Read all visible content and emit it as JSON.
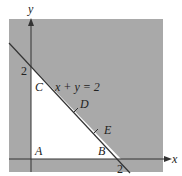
{
  "diagram": {
    "colors": {
      "shade": "#a9a9a9",
      "feasible": "#ffffff",
      "line": "#333333",
      "axis": "#333333"
    },
    "axes": {
      "x_label": "x",
      "y_label": "y",
      "x_tick": "2",
      "y_tick": "2"
    },
    "constraint_label": "x + y = 2",
    "points": {
      "A": "A",
      "B": "B",
      "C": "C",
      "D": "D",
      "E": "E"
    }
  }
}
